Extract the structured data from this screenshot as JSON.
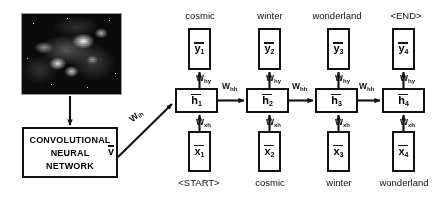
{
  "figure": {
    "encoder": {
      "image_alt": "nebula-photograph",
      "cnn_lines": [
        "CONVOLUTIONAL",
        "NEURAL",
        "NETWORK"
      ],
      "feature_symbol": "v",
      "feature_bar": true,
      "input_weight": {
        "base": "W",
        "sub": "ih"
      }
    },
    "weights": {
      "hidden_to_output": {
        "base": "W",
        "sub": "hy"
      },
      "hidden_to_hidden": {
        "base": "W",
        "sub": "hh"
      },
      "input_to_hidden": {
        "base": "W",
        "sub": "xh"
      }
    },
    "timesteps": [
      {
        "index": "1",
        "output_word": "cosmic",
        "output_symbol": "y",
        "hidden_symbol": "h",
        "input_symbol": "x",
        "input_word": "<START>"
      },
      {
        "index": "2",
        "output_word": "winter",
        "output_symbol": "y",
        "hidden_symbol": "h",
        "input_symbol": "x",
        "input_word": "cosmic"
      },
      {
        "index": "3",
        "output_word": "wonderland",
        "output_symbol": "y",
        "hidden_symbol": "h",
        "input_symbol": "x",
        "input_word": "winter"
      },
      {
        "index": "4",
        "output_word": "<END>",
        "output_symbol": "y",
        "hidden_symbol": "h",
        "input_symbol": "x",
        "input_word": "wonderland"
      }
    ],
    "colors": {
      "stroke": "#111111",
      "background": "#ffffff",
      "image_dark": "#0a0a0a"
    }
  }
}
